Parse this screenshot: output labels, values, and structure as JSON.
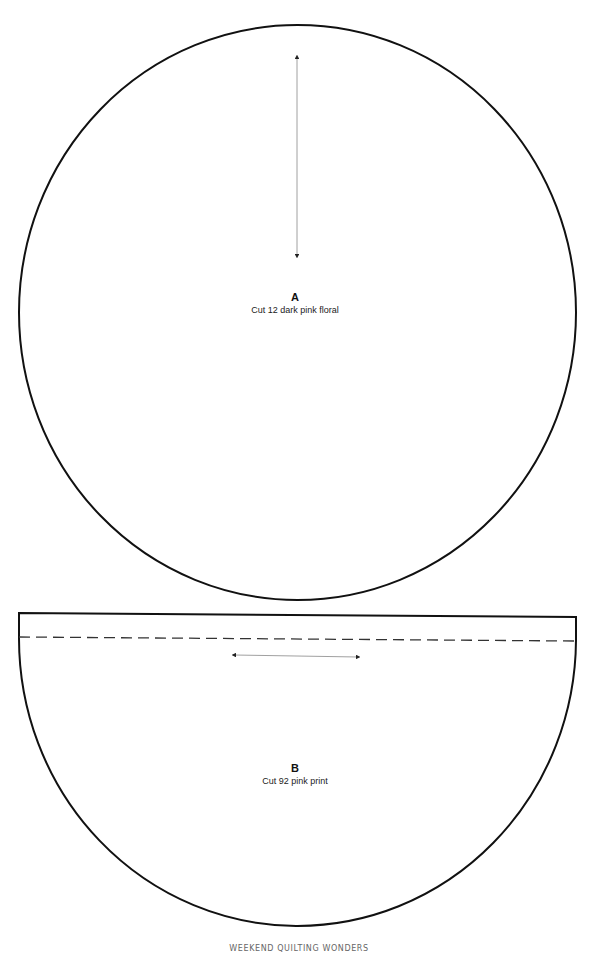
{
  "pattern_a": {
    "letter": "A",
    "instruction": "Cut 12 dark pink floral",
    "shape": "circle",
    "grain_arrow": "vertical"
  },
  "pattern_b": {
    "letter": "B",
    "instruction": "Cut 92 pink print",
    "shape": "half-circle with seam allowance",
    "grain_arrow": "horizontal"
  },
  "footer": {
    "text": "WEEKEND QUILTING WONDERS"
  },
  "colors": {
    "outline": "#111111",
    "dashed": "#333333",
    "arrow": "#777777",
    "footer_text": "#666666"
  }
}
